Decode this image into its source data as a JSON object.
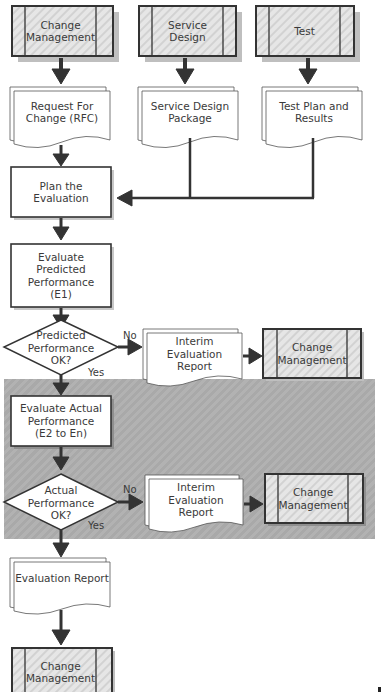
{
  "diagram": {
    "title": "",
    "sources": [
      {
        "id": "src-change-management",
        "label": "Change\nManagement",
        "type": "predefined-process"
      },
      {
        "id": "src-service-design",
        "label": "Service\nDesign",
        "type": "predefined-process"
      },
      {
        "id": "src-test",
        "label": "Test",
        "type": "predefined-process"
      }
    ],
    "documents": [
      {
        "id": "doc-rfc",
        "label": "Request For\nChange (RFC)",
        "type": "multi-document"
      },
      {
        "id": "doc-sdp",
        "label": "Service Design\nPackage",
        "type": "multi-document"
      },
      {
        "id": "doc-test-plan",
        "label": "Test Plan and\nResults",
        "type": "multi-document"
      }
    ],
    "process_plan": {
      "id": "plan-evaluation",
      "label": "Plan the\nEvaluation",
      "type": "process"
    },
    "process_predicted": {
      "id": "evaluate-predicted",
      "label": "Evaluate\nPredicted\nPerformance\n(E1)",
      "type": "process"
    },
    "decision_predicted": {
      "id": "decision-predicted",
      "label": "Predicted\nPerformance\nOK?",
      "type": "decision",
      "no_label": "No",
      "yes_label": "Yes"
    },
    "interim_report_1": {
      "id": "interim-report-1",
      "label": "Interim Evaluation\nReport",
      "type": "multi-document"
    },
    "change_mgmt_1": {
      "id": "change-mgmt-1",
      "label": "Change\nManagement",
      "type": "predefined-process"
    },
    "process_actual": {
      "id": "evaluate-actual",
      "label": "Evaluate Actual\nPerformance\n(E2 to En)",
      "type": "process"
    },
    "decision_actual": {
      "id": "decision-actual",
      "label": "Actual\nPerformance\nOK?",
      "type": "decision",
      "no_label": "No",
      "yes_label": "Yes"
    },
    "interim_report_2": {
      "id": "interim-report-2",
      "label": "Interim Evaluation\nReport",
      "type": "multi-document"
    },
    "change_mgmt_2": {
      "id": "change-mgmt-2",
      "label": "Change\nManagement",
      "type": "predefined-process"
    },
    "evaluation_report": {
      "id": "evaluation-report",
      "label": "Evaluation Report",
      "type": "multi-document"
    },
    "change_mgmt_final": {
      "id": "change-mgmt-final",
      "label": "Change\nManagement",
      "type": "predefined-process"
    },
    "colors": {
      "stroke": "#333333",
      "arrow": "#333333",
      "predefined_fill": "#e4e4e4",
      "band_fill": "#adadad",
      "shadow": "#bdbdbd"
    }
  }
}
